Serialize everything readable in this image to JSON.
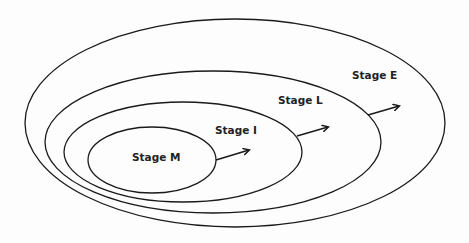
{
  "diagram": {
    "type": "nested-ellipses",
    "stroke_color": "#1a1a1a",
    "background": "#fdfdfd",
    "stages": [
      {
        "id": "M",
        "label": "Stage M",
        "ellipse": {
          "cx": 152,
          "cy": 160,
          "rx": 64,
          "ry": 33
        },
        "label_pos": {
          "x": 132,
          "y": 161
        },
        "arrow": {
          "x1": 216,
          "y1": 160,
          "x2": 249,
          "y2": 150
        }
      },
      {
        "id": "I",
        "label": "Stage I",
        "ellipse": {
          "cx": 183,
          "cy": 152,
          "rx": 119,
          "ry": 50
        },
        "label_pos": {
          "x": 215,
          "y": 134
        },
        "arrow": {
          "x1": 297,
          "y1": 136,
          "x2": 328,
          "y2": 127
        }
      },
      {
        "id": "L",
        "label": "Stage L",
        "ellipse": {
          "cx": 213,
          "cy": 142,
          "rx": 168,
          "ry": 71
        },
        "label_pos": {
          "x": 278,
          "y": 104
        },
        "arrow": {
          "x1": 368,
          "y1": 115,
          "x2": 399,
          "y2": 106
        }
      },
      {
        "id": "E",
        "label": "Stage E",
        "ellipse": {
          "cx": 235,
          "cy": 123,
          "rx": 210,
          "ry": 104
        },
        "label_pos": {
          "x": 352,
          "y": 79
        },
        "arrow": null
      }
    ]
  }
}
